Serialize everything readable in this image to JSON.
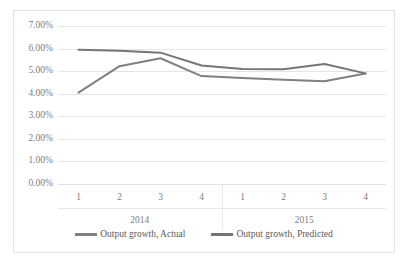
{
  "chart_data": {
    "type": "line",
    "title": "",
    "xlabel": "",
    "ylabel": "",
    "grid": true,
    "legend_position": "bottom",
    "ylim": [
      0,
      0.07
    ],
    "ytick_labels": [
      "7.00%",
      "6.00%",
      "5.00%",
      "4.00%",
      "3.00%",
      "2.00%",
      "1.00%",
      "0.00%"
    ],
    "ytick_values": [
      0.07,
      0.06,
      0.05,
      0.04,
      0.03,
      0.02,
      0.01,
      0.0
    ],
    "categories": [
      "1",
      "2",
      "3",
      "4",
      "1",
      "2",
      "3",
      "4"
    ],
    "group_labels": [
      "2014",
      "2015"
    ],
    "x": [
      "2014 Q1",
      "2014 Q2",
      "2014 Q3",
      "2014 Q4",
      "2015 Q1",
      "2015 Q2",
      "2015 Q3",
      "2015 Q4"
    ],
    "series": [
      {
        "name": "Output growth, Actual",
        "color": "#808080",
        "values": [
          0.0405,
          0.0522,
          0.0557,
          0.0478,
          0.047,
          0.0462,
          0.0455,
          0.049
        ],
        "value_labels": [
          "4.05%",
          "5.22%",
          "5.57%",
          "4.78%",
          "4.70%",
          "4.62%",
          "4.55%",
          "4.90%"
        ]
      },
      {
        "name": "Output growth, Predicted",
        "color": "#767676",
        "values": [
          0.0595,
          0.059,
          0.0582,
          0.0525,
          0.051,
          0.0508,
          0.0532,
          0.049
        ],
        "value_labels": [
          "5.95%",
          "5.90%",
          "5.82%",
          "5.25%",
          "5.10%",
          "5.08%",
          "5.32%",
          "4.90%"
        ]
      }
    ]
  },
  "legend": {
    "items": [
      {
        "label": "Output growth, Actual"
      },
      {
        "label": "Output growth, Predicted"
      }
    ]
  },
  "colors": {
    "actual_line": "#808080",
    "predicted_line": "#767676",
    "gridline": "#e6e6e6",
    "axis_text": "#7d7d7d",
    "frame_border": "#e2e2e2",
    "background": "#ffffff"
  }
}
